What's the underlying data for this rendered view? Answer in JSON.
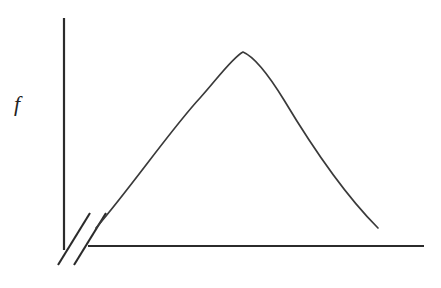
{
  "figure": {
    "background_color": "#ffffff",
    "width": 441,
    "height": 288,
    "ink_color": "#2b2b2b",
    "curve_color": "#3a3a3a"
  },
  "labels": {
    "y_axis_label": "f",
    "x_axis_label": ""
  },
  "icons": {
    "axis_break": "axis-break-double-slash"
  },
  "chart_data": {
    "type": "line",
    "title": "",
    "subtitle": "",
    "xlabel": "",
    "ylabel": "f",
    "grid": false,
    "legend": null,
    "annotations": [
      {
        "name": "axis-break",
        "text": "",
        "note": "double slash break mark on both axes near the origin"
      }
    ],
    "axes": {
      "y_axis": {
        "label": "f",
        "tick_labels": [],
        "has_break": true,
        "drawn_from_px": [
          64,
          18
        ],
        "drawn_to_px": [
          64,
          250
        ]
      },
      "x_axis": {
        "label": "",
        "tick_labels": [],
        "has_break": true,
        "drawn_from_px": [
          88,
          246
        ],
        "drawn_to_px": [
          424,
          246
        ]
      }
    },
    "series": [
      {
        "name": "f",
        "style": "smooth-hump",
        "x": [
          96,
          120,
          145,
          170,
          195,
          220,
          243,
          266,
          290,
          312,
          335,
          357,
          378
        ],
        "y": [
          228,
          199,
          169,
          142,
          114,
          82,
          52,
          56,
          80,
          112,
          148,
          188,
          228
        ],
        "x_pixels": [
          96,
          120,
          145,
          170,
          195,
          220,
          243,
          266,
          290,
          312,
          335,
          357,
          378
        ],
        "y_pixels": [
          228,
          199,
          169,
          142,
          114,
          82,
          52,
          56,
          80,
          112,
          148,
          188,
          228
        ],
        "peak": {
          "x": 243,
          "y": 52
        }
      }
    ],
    "ylim": [
      246,
      18
    ],
    "xlim": [
      64,
      424
    ]
  },
  "geometry": {
    "y_axis": {
      "x": 64,
      "y_top": 18,
      "y_bottom": 250
    },
    "x_axis": {
      "y": 246,
      "x_left": 88,
      "x_right": 424
    },
    "break_slashes": [
      {
        "x1": 58,
        "y1": 265,
        "x2": 90,
        "y2": 213
      },
      {
        "x1": 74,
        "y1": 265,
        "x2": 106,
        "y2": 213
      }
    ],
    "curve_path": "M 96 228 C 132 186, 172 128, 200 98 C 218 78, 232 58, 243 52 C 255 57, 268 74, 284 100 C 308 140, 342 192, 378 228"
  }
}
